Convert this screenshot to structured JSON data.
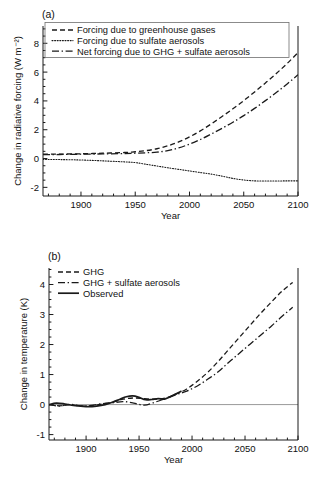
{
  "figure": {
    "background": "#ffffff",
    "line_color": "#1a1a1a",
    "zero_line_color": "#8d8d8d"
  },
  "panels": [
    {
      "id": "a",
      "label": "(a)",
      "xlabel": "Year",
      "ylabel": "Change in radiative forcing (W m⁻²)",
      "xlim": [
        1865,
        2100
      ],
      "ylim": [
        -2.6,
        9.2
      ],
      "xticks": [
        1900,
        1950,
        2000,
        2050,
        2100
      ],
      "xtick_labels": [
        "1900",
        "1950",
        "2000",
        "2050",
        "2100"
      ],
      "xminor_step": 10,
      "yticks": [
        -2,
        0,
        2,
        4,
        6,
        8
      ],
      "ytick_labels": [
        "-2",
        "0",
        "2",
        "4",
        "6",
        "8"
      ],
      "yminor_step": 0.5,
      "zero_line": false,
      "legend": {
        "position": "top-left",
        "entries": [
          {
            "label": "Forcing due to greenhouse gases",
            "dash": "dashed"
          },
          {
            "label": "Forcing due to sulfate aerosols",
            "dash": "dotted"
          },
          {
            "label": "Net forcing due to GHG + sulfate aerosols",
            "dash": "dashdot"
          }
        ]
      }
    },
    {
      "id": "b",
      "label": "(b)",
      "xlabel": "Year",
      "ylabel": "Change in temperature (K)",
      "xlim": [
        1865,
        2100
      ],
      "ylim": [
        -1.18,
        4.55
      ],
      "xticks": [
        1900,
        1950,
        2000,
        2050,
        2100
      ],
      "xtick_labels": [
        "1900",
        "1950",
        "2000",
        "2050",
        "2100"
      ],
      "xminor_step": 10,
      "yticks": [
        -1,
        0,
        1,
        2,
        3,
        4
      ],
      "ytick_labels": [
        "-1",
        "0",
        "1",
        "2",
        "3",
        "4"
      ],
      "yminor_step": 0.25,
      "zero_line": true,
      "legend": {
        "position": "top-left",
        "entries": [
          {
            "label": "GHG",
            "dash": "dashed"
          },
          {
            "label": "GHG + sulfate aerosols",
            "dash": "dashdot"
          },
          {
            "label": "Observed",
            "dash": "solid"
          }
        ]
      }
    }
  ],
  "chart_data": [
    {
      "type": "line",
      "panel": "a",
      "title": "(a) Change in radiative forcing",
      "xlabel": "Year",
      "ylabel": "Change in radiative forcing (W m-2)",
      "xlim": [
        1865,
        2100
      ],
      "ylim": [
        -2.6,
        9.2
      ],
      "grid": false,
      "legend_position": "top-left",
      "x": [
        1865,
        1880,
        1900,
        1920,
        1940,
        1950,
        1960,
        1970,
        1980,
        1990,
        2000,
        2010,
        2020,
        2030,
        2040,
        2050,
        2060,
        2070,
        2080,
        2090,
        2100
      ],
      "series": [
        {
          "name": "Forcing due to greenhouse gases",
          "dash": "dashed",
          "values": [
            0.3,
            0.31,
            0.33,
            0.37,
            0.42,
            0.47,
            0.55,
            0.68,
            0.88,
            1.15,
            1.5,
            1.92,
            2.4,
            2.92,
            3.45,
            4.02,
            4.62,
            5.25,
            5.9,
            6.6,
            7.35
          ]
        },
        {
          "name": "Forcing due to sulfate aerosols",
          "dash": "dotted",
          "values": [
            -0.06,
            -0.07,
            -0.1,
            -0.16,
            -0.23,
            -0.28,
            -0.4,
            -0.52,
            -0.64,
            -0.75,
            -0.86,
            -0.97,
            -1.08,
            -1.22,
            -1.38,
            -1.49,
            -1.55,
            -1.56,
            -1.56,
            -1.55,
            -1.55
          ]
        },
        {
          "name": "Net forcing due to GHG + sulfate aerosols",
          "dash": "dashdot",
          "values": [
            0.27,
            0.28,
            0.3,
            0.32,
            0.35,
            0.37,
            0.4,
            0.44,
            0.55,
            0.74,
            1.0,
            1.32,
            1.7,
            2.1,
            2.52,
            2.98,
            3.48,
            4.02,
            4.58,
            5.18,
            5.82
          ]
        }
      ]
    },
    {
      "type": "line",
      "panel": "b",
      "title": "(b) Change in temperature",
      "xlabel": "Year",
      "ylabel": "Change in temperature (K)",
      "xlim": [
        1865,
        2100
      ],
      "ylim": [
        -1.18,
        4.55
      ],
      "grid": false,
      "legend_position": "top-left",
      "series": [
        {
          "name": "GHG",
          "dash": "dashed",
          "x": [
            1865,
            1875,
            1885,
            1895,
            1905,
            1915,
            1925,
            1935,
            1945,
            1955,
            1965,
            1975,
            1985,
            1995,
            2005,
            2015,
            2025,
            2035,
            2045,
            2055,
            2065,
            2075,
            2085,
            2095
          ],
          "values": [
            0.0,
            -0.04,
            0.0,
            -0.05,
            -0.04,
            0.02,
            0.08,
            0.18,
            0.22,
            0.2,
            0.18,
            0.22,
            0.35,
            0.52,
            0.78,
            1.08,
            1.45,
            1.85,
            2.25,
            2.65,
            3.05,
            3.42,
            3.78,
            4.07
          ]
        },
        {
          "name": "GHG + sulfate aerosols",
          "dash": "dashdot",
          "x": [
            1865,
            1875,
            1885,
            1895,
            1905,
            1915,
            1925,
            1935,
            1945,
            1955,
            1965,
            1975,
            1985,
            1995,
            2005,
            2015,
            2025,
            2035,
            2045,
            2055,
            2065,
            2075,
            2085,
            2095
          ],
          "values": [
            0.0,
            -0.05,
            0.01,
            -0.04,
            -0.03,
            0.03,
            0.06,
            0.1,
            0.05,
            -0.02,
            0.08,
            0.2,
            0.33,
            0.45,
            0.62,
            0.85,
            1.1,
            1.42,
            1.72,
            2.02,
            2.32,
            2.62,
            2.94,
            3.24
          ]
        },
        {
          "name": "Observed",
          "dash": "solid",
          "x": [
            1865,
            1872,
            1880,
            1888,
            1895,
            1902,
            1910,
            1918,
            1925,
            1932,
            1938,
            1944,
            1950,
            1956,
            1962,
            1968,
            1974,
            1980,
            1986,
            1990
          ],
          "values": [
            0.0,
            0.05,
            0.02,
            -0.03,
            -0.05,
            -0.07,
            -0.05,
            0.0,
            0.08,
            0.18,
            0.26,
            0.29,
            0.24,
            0.16,
            0.17,
            0.2,
            0.18,
            0.27,
            0.38,
            0.45
          ]
        }
      ]
    }
  ]
}
